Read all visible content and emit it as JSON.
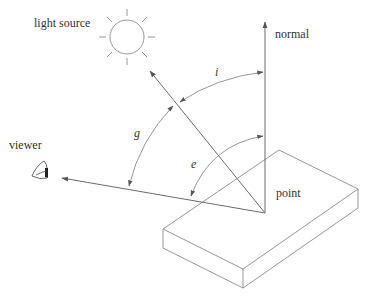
{
  "figure": {
    "labels": {
      "light_source": "light source",
      "normal": "normal",
      "viewer": "viewer",
      "point": "point"
    },
    "angles": {
      "incidence": "i",
      "phase": "g",
      "emittance": "e"
    },
    "colors": {
      "line": "#6b6b6b",
      "text": "#333333",
      "background": "#ffffff"
    }
  }
}
